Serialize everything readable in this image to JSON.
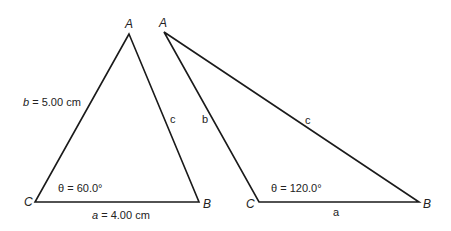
{
  "figure": {
    "triangle_left": {
      "vertices": {
        "A": "A",
        "B": "B",
        "C": "C"
      },
      "side_b_var": "b",
      "side_b_rest": " = 5.00 cm",
      "side_a_var": "a",
      "side_a_rest": " = 4.00 cm",
      "side_c": "c",
      "angle_label": "θ = 60.0°"
    },
    "triangle_right": {
      "vertices": {
        "A": "A",
        "B": "B",
        "C": "C"
      },
      "side_b": "b",
      "side_a": "a",
      "side_c": "c",
      "angle_label": "θ = 120.0°"
    },
    "colors": {
      "line": "#1a1a1a",
      "background": "#ffffff"
    }
  }
}
